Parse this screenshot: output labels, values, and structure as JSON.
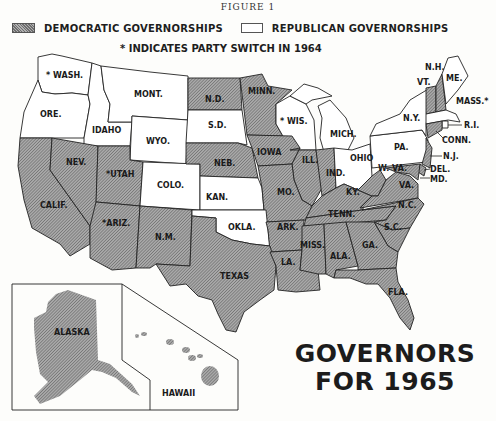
{
  "figure_label": "FIGURE 1",
  "legend": {
    "democratic_label": "DEMOCRATIC GOVERNORSHIPS",
    "republican_label": "REPUBLICAN GOVERNORSHIPS",
    "switch_note": "* INDICATES PARTY SWITCH IN 1964",
    "democratic_pattern": "hatched-gray",
    "republican_pattern": "white"
  },
  "colors": {
    "democratic_fill": "#8f8f8f",
    "republican_fill": "#ffffff",
    "border": "#222222",
    "text": "#1a1a1a"
  },
  "title": {
    "line1": "GOVERNORS",
    "line2": "FOR 1965"
  },
  "states": {
    "wash": {
      "label": "* WASH.",
      "party": "Republican",
      "switch": true
    },
    "ore": {
      "label": "ORE.",
      "party": "Republican",
      "switch": false
    },
    "idaho": {
      "label": "IDAHO",
      "party": "Republican",
      "switch": false
    },
    "mont": {
      "label": "MONT.",
      "party": "Republican",
      "switch": false
    },
    "wyo": {
      "label": "WYO.",
      "party": "Republican",
      "switch": false
    },
    "nd": {
      "label": "N.D.",
      "party": "Democratic",
      "switch": false
    },
    "sd": {
      "label": "S.D.",
      "party": "Republican",
      "switch": false
    },
    "minn": {
      "label": "MINN.",
      "party": "Democratic",
      "switch": false
    },
    "wis": {
      "label": "* WIS.",
      "party": "Republican",
      "switch": true
    },
    "mich": {
      "label": "MICH.",
      "party": "Republican",
      "switch": false
    },
    "calif": {
      "label": "CALIF.",
      "party": "Democratic",
      "switch": false
    },
    "nev": {
      "label": "NEV.",
      "party": "Democratic",
      "switch": false
    },
    "utah": {
      "label": "*UTAH",
      "party": "Democratic",
      "switch": true
    },
    "colo": {
      "label": "COLO.",
      "party": "Republican",
      "switch": false
    },
    "neb": {
      "label": "NEB.",
      "party": "Democratic",
      "switch": false
    },
    "iowa": {
      "label": "IOWA",
      "party": "Democratic",
      "switch": false
    },
    "ill": {
      "label": "ILL.",
      "party": "Democratic",
      "switch": false
    },
    "ind": {
      "label": "IND.",
      "party": "Democratic",
      "switch": false
    },
    "ohio": {
      "label": "OHIO",
      "party": "Republican",
      "switch": false
    },
    "pa": {
      "label": "PA.",
      "party": "Republican",
      "switch": false
    },
    "ny": {
      "label": "N.Y.",
      "party": "Republican",
      "switch": false
    },
    "vt": {
      "label": "VT.",
      "party": "Democratic",
      "switch": false
    },
    "nh": {
      "label": "N.H.",
      "party": "Democratic",
      "switch": false
    },
    "me": {
      "label": "ME.",
      "party": "Republican",
      "switch": false
    },
    "mass": {
      "label": "MASS.*",
      "party": "Republican",
      "switch": true
    },
    "ri": {
      "label": "R.I.",
      "party": "Republican",
      "switch": false
    },
    "conn": {
      "label": "CONN.",
      "party": "Democratic",
      "switch": false
    },
    "nj": {
      "label": "N.J.",
      "party": "Democratic",
      "switch": false
    },
    "del": {
      "label": "DEL.",
      "party": "Democratic",
      "switch": false
    },
    "md": {
      "label": "MD.",
      "party": "Democratic",
      "switch": false
    },
    "kan": {
      "label": "KAN.",
      "party": "Republican",
      "switch": false
    },
    "mo": {
      "label": "MO.",
      "party": "Democratic",
      "switch": false
    },
    "ky": {
      "label": "KY.",
      "party": "Democratic",
      "switch": false
    },
    "wva": {
      "label": "W. VA.",
      "party": "Democratic",
      "switch": false
    },
    "va": {
      "label": "VA.",
      "party": "Democratic",
      "switch": false
    },
    "ariz": {
      "label": "*ARIZ.",
      "party": "Democratic",
      "switch": true
    },
    "nm": {
      "label": "N.M.",
      "party": "Democratic",
      "switch": false
    },
    "okla": {
      "label": "OKLA.",
      "party": "Republican",
      "switch": false
    },
    "ark": {
      "label": "ARK.",
      "party": "Democratic",
      "switch": false
    },
    "tenn": {
      "label": "TENN.",
      "party": "Democratic",
      "switch": false
    },
    "nc": {
      "label": "N.C.",
      "party": "Democratic",
      "switch": false
    },
    "sc": {
      "label": "S.C.",
      "party": "Democratic",
      "switch": false
    },
    "texas": {
      "label": "TEXAS",
      "party": "Democratic",
      "switch": false
    },
    "la": {
      "label": "LA.",
      "party": "Democratic",
      "switch": false
    },
    "miss": {
      "label": "MISS.",
      "party": "Democratic",
      "switch": false
    },
    "ala": {
      "label": "ALA.",
      "party": "Democratic",
      "switch": false
    },
    "ga": {
      "label": "GA.",
      "party": "Democratic",
      "switch": false
    },
    "fla": {
      "label": "FLA.",
      "party": "Democratic",
      "switch": false
    },
    "alaska": {
      "label": "ALASKA",
      "party": "Democratic",
      "switch": false
    },
    "hawaii": {
      "label": "HAWAII",
      "party": "Democratic",
      "switch": false
    }
  }
}
